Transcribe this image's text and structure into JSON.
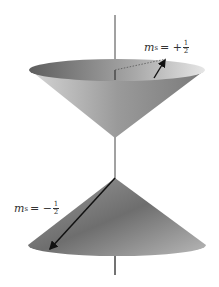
{
  "diagram": {
    "labels": {
      "upper": {
        "symbol": "m",
        "subscript": "s",
        "sign": "= +",
        "num": "1",
        "den": "2"
      },
      "lower": {
        "symbol": "m",
        "subscript": "s",
        "sign": "= −",
        "num": "1",
        "den": "2"
      }
    },
    "colors": {
      "cone_dark": "#6e6e6e",
      "cone_light": "#d8d8d8",
      "axis": "#444444",
      "arrow": "#111111"
    }
  }
}
